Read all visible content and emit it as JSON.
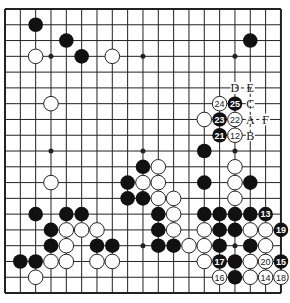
{
  "board": {
    "size": 19,
    "origin": [
      5,
      9
    ],
    "spacing": [
      15.33,
      15.78
    ],
    "colors": {
      "line": "#222222",
      "black": "#111111",
      "white": "#ffffff",
      "background": "#ffffff"
    },
    "hoshi": [
      [
        3,
        3
      ],
      [
        9,
        3
      ],
      [
        15,
        3
      ],
      [
        3,
        9
      ],
      [
        9,
        9
      ],
      [
        15,
        9
      ],
      [
        3,
        15
      ],
      [
        9,
        15
      ],
      [
        15,
        15
      ]
    ],
    "black_stones": [
      [
        2,
        1
      ],
      [
        4,
        2
      ],
      [
        5,
        3
      ],
      [
        16,
        2
      ],
      [
        13,
        9
      ],
      [
        9,
        10
      ],
      [
        8,
        11
      ],
      [
        13,
        11
      ],
      [
        16,
        11
      ],
      [
        8,
        12
      ],
      [
        9,
        12
      ],
      [
        10,
        13
      ],
      [
        13,
        13
      ],
      [
        14,
        13
      ],
      [
        15,
        13
      ],
      [
        16,
        13
      ],
      [
        10,
        14
      ],
      [
        14,
        14
      ],
      [
        15,
        14
      ],
      [
        2,
        13
      ],
      [
        4,
        13
      ],
      [
        5,
        13
      ],
      [
        3,
        14
      ],
      [
        3,
        15
      ],
      [
        6,
        15
      ],
      [
        7,
        15
      ],
      [
        10,
        15
      ],
      [
        11,
        15
      ],
      [
        1,
        16
      ],
      [
        2,
        16
      ],
      [
        14,
        15
      ],
      [
        16,
        15
      ],
      [
        15,
        16
      ],
      [
        15,
        17
      ]
    ],
    "white_stones": [
      [
        2,
        3
      ],
      [
        7,
        3
      ],
      [
        3,
        6
      ],
      [
        13,
        7
      ],
      [
        10,
        10
      ],
      [
        15,
        10
      ],
      [
        9,
        11
      ],
      [
        10,
        11
      ],
      [
        15,
        11
      ],
      [
        10,
        12
      ],
      [
        11,
        12
      ],
      [
        15,
        12
      ],
      [
        11,
        13
      ],
      [
        11,
        14
      ],
      [
        13,
        14
      ],
      [
        16,
        14
      ],
      [
        17,
        14
      ],
      [
        3,
        11
      ],
      [
        4,
        14
      ],
      [
        5,
        14
      ],
      [
        6,
        14
      ],
      [
        4,
        15
      ],
      [
        3,
        16
      ],
      [
        4,
        16
      ],
      [
        6,
        16
      ],
      [
        7,
        16
      ],
      [
        2,
        17
      ],
      [
        12,
        15
      ],
      [
        13,
        15
      ],
      [
        17,
        15
      ],
      [
        13,
        16
      ],
      [
        16,
        16
      ],
      [
        16,
        17
      ]
    ],
    "numbered_black": [
      {
        "n": "13",
        "pos": [
          17,
          13
        ]
      },
      {
        "n": "15",
        "pos": [
          18,
          16
        ]
      },
      {
        "n": "17",
        "pos": [
          14,
          16
        ]
      },
      {
        "n": "19",
        "pos": [
          18,
          14
        ]
      },
      {
        "n": "21",
        "pos": [
          14,
          8
        ]
      },
      {
        "n": "23",
        "pos": [
          14,
          7
        ]
      },
      {
        "n": "25",
        "pos": [
          15,
          6
        ]
      }
    ],
    "numbered_white": [
      {
        "n": "12",
        "pos": [
          15,
          8
        ]
      },
      {
        "n": "14",
        "pos": [
          17,
          17
        ]
      },
      {
        "n": "16",
        "pos": [
          14,
          17
        ]
      },
      {
        "n": "18",
        "pos": [
          18,
          17
        ]
      },
      {
        "n": "20",
        "pos": [
          17,
          16
        ]
      },
      {
        "n": "22",
        "pos": [
          15,
          7
        ]
      },
      {
        "n": "24",
        "pos": [
          14,
          6
        ]
      }
    ],
    "letter_marks": [
      {
        "label": "D",
        "pos": [
          15,
          5
        ]
      },
      {
        "label": "E",
        "pos": [
          16,
          5
        ]
      },
      {
        "label": "C",
        "pos": [
          16,
          6
        ]
      },
      {
        "label": "A",
        "pos": [
          16,
          7
        ]
      },
      {
        "label": "F",
        "pos": [
          17,
          7
        ]
      },
      {
        "label": "B",
        "pos": [
          16,
          8
        ]
      }
    ],
    "dashed_links": [
      [
        [
          15,
          5
        ],
        [
          16,
          5
        ]
      ],
      [
        [
          16,
          5
        ],
        [
          16,
          8
        ]
      ],
      [
        [
          16,
          7
        ],
        [
          17,
          7
        ]
      ]
    ]
  }
}
